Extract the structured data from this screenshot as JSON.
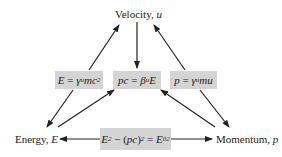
{
  "nodes": {
    "velocity": {
      "label": "Velocity, ",
      "symbol": "u"
    },
    "energy": {
      "label": "Energy, ",
      "symbol": "E"
    },
    "momentum": {
      "label": "Momentum, ",
      "symbol": "p"
    }
  },
  "equations": {
    "energy_eq": {
      "lhs": "E",
      "eq": " = ",
      "gamma": "γ",
      "gamma_sub": "u",
      "rest": "mc",
      "sup": "2"
    },
    "pc_eq": {
      "lhs": "pc",
      "eq": " = ",
      "beta": "β",
      "beta_sub": "u",
      "rest": "E"
    },
    "momentum_eq": {
      "lhs": "p",
      "eq": " = ",
      "gamma": "γ",
      "gamma_sub": "u",
      "rest": "mu"
    },
    "invariant_eq": {
      "e": "E",
      "e_sup": "2",
      "minus": " − (",
      "pc": "pc",
      "close": ")",
      "pc_sup": "2",
      "eq": " = ",
      "e0": "E",
      "e0_sub": "0",
      "e0_sup": "2"
    }
  },
  "colors": {
    "box_fill": "#d4d4d4",
    "arrow": "#222222",
    "background": "#ffffff"
  }
}
